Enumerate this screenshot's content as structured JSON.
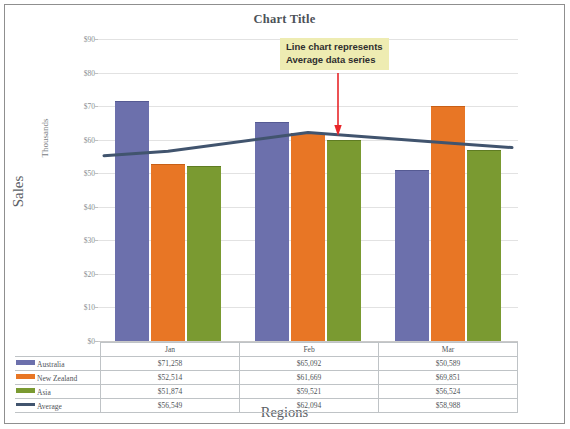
{
  "chart_data": {
    "type": "bar",
    "title": "Chart Title",
    "xlabel": "Regions",
    "ylabel": "Sales",
    "y_units_label": "Thousands",
    "categories": [
      "Jan",
      "Feb",
      "Mar"
    ],
    "ylim": [
      0,
      90000
    ],
    "y_tick_values": [
      0,
      10000,
      20000,
      30000,
      40000,
      50000,
      60000,
      70000,
      80000,
      90000
    ],
    "y_tick_labels": [
      "$0",
      "$10",
      "$20",
      "$30",
      "$40",
      "$50",
      "$60",
      "$70",
      "$80",
      "$90"
    ],
    "grid": true,
    "legend_position": "data-table",
    "series": [
      {
        "name": "Australia",
        "type": "bar",
        "color": "#6c70ac",
        "values": [
          71258,
          65092,
          50589
        ],
        "value_labels": [
          "$71,258",
          "$65,092",
          "$50,589"
        ]
      },
      {
        "name": "New Zealand",
        "type": "bar",
        "color": "#e87625",
        "values": [
          52514,
          61669,
          69851
        ],
        "value_labels": [
          "$52,514",
          "$61,669",
          "$69,851"
        ]
      },
      {
        "name": "Asia",
        "type": "bar",
        "color": "#7a9a31",
        "values": [
          51874,
          59521,
          56524
        ],
        "value_labels": [
          "$51,874",
          "$59,521",
          "$56,524"
        ]
      },
      {
        "name": "Average",
        "type": "line",
        "color": "#41546e",
        "values": [
          56549,
          62094,
          58988
        ],
        "value_labels": [
          "$56,549",
          "$62,094",
          "$58,988"
        ]
      }
    ],
    "annotations": [
      {
        "text_line_1": "Line chart represents",
        "text_line_2": "Average data series",
        "background": "#eeecb2",
        "arrow_color": "#e8262a",
        "points_to": "Average"
      }
    ]
  },
  "data_table": {
    "column_headers": [
      "",
      "Jan",
      "Feb",
      "Mar"
    ],
    "rows": [
      {
        "label": "Australia",
        "cells": [
          "$71,258",
          "$65,092",
          "$50,589"
        ]
      },
      {
        "label": "New Zealand",
        "cells": [
          "$52,514",
          "$61,669",
          "$69,851"
        ]
      },
      {
        "label": "Asia",
        "cells": [
          "$51,874",
          "$59,521",
          "$56,524"
        ]
      },
      {
        "label": "Average",
        "cells": [
          "$56,549",
          "$62,094",
          "$58,988"
        ]
      }
    ]
  }
}
